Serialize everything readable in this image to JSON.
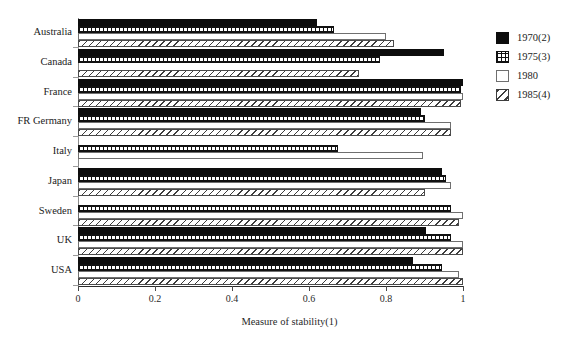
{
  "chart_data": {
    "type": "bar",
    "orientation": "horizontal",
    "title": "",
    "xlabel": "Measure of stability(1)",
    "ylabel": "",
    "xlim": [
      0,
      1
    ],
    "xticks": [
      0,
      0.2,
      0.4,
      0.6,
      0.8,
      1
    ],
    "xtick_labels": [
      "0",
      "0.2",
      "0.4",
      "0.6",
      "0.8",
      "1"
    ],
    "grid": false,
    "legend_position": "right",
    "categories": [
      "Australia",
      "Canada",
      "France",
      "FR Germany",
      "Italy",
      "Japan",
      "Sweden",
      "UK",
      "USA"
    ],
    "series": [
      {
        "name": "1970(2)",
        "style": "solid-black",
        "values": [
          0.62,
          0.95,
          1.0,
          0.89,
          null,
          0.945,
          null,
          0.905,
          0.87
        ]
      },
      {
        "name": "1975(3)",
        "style": "dotted-grid",
        "values": [
          0.665,
          0.785,
          0.995,
          0.9,
          0.675,
          0.955,
          0.97,
          0.97,
          0.945
        ]
      },
      {
        "name": "1980",
        "style": "white",
        "values": [
          0.8,
          null,
          1.0,
          0.97,
          0.895,
          0.97,
          1.0,
          1.0,
          0.99
        ]
      },
      {
        "name": "1985(4)",
        "style": "diagonal-hatch",
        "values": [
          0.82,
          0.73,
          0.995,
          0.97,
          null,
          0.9,
          0.99,
          1.0,
          1.0
        ]
      }
    ]
  },
  "legend": {
    "items": [
      {
        "label": "1970(2)",
        "style": "s1970"
      },
      {
        "label": "1975(3)",
        "style": "s1975"
      },
      {
        "label": "1980",
        "style": "s1980"
      },
      {
        "label": "1985(4)",
        "style": "s1985"
      }
    ]
  },
  "colors": {
    "bar_fill_1970": "#0d0d0d",
    "bar_outline": "#111111",
    "axis": "#2a2a2a",
    "background": "#ffffff",
    "text": "#1b1b1b"
  }
}
